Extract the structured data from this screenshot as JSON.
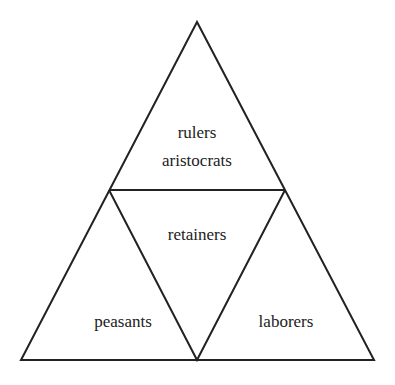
{
  "diagram": {
    "type": "social-hierarchy-triangle",
    "colors": {
      "line": "#222222",
      "text": "#222222",
      "background": "#ffffff"
    },
    "sections": {
      "top": {
        "lines": [
          "rulers",
          "aristocrats"
        ]
      },
      "center": {
        "label": "retainers"
      },
      "bottom_left": {
        "label": "peasants"
      },
      "bottom_right": {
        "label": "laborers"
      }
    }
  }
}
